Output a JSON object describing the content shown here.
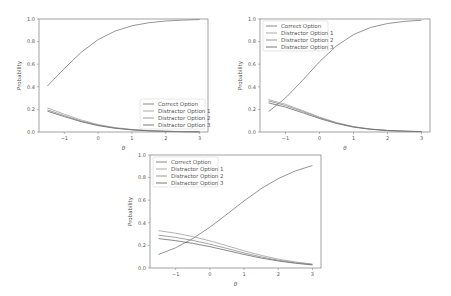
{
  "chart_data": [
    {
      "type": "line",
      "title": "",
      "xlabel": "θ",
      "ylabel": "Probability",
      "xlim": [
        -1.75,
        3.25
      ],
      "ylim": [
        0.0,
        1.0
      ],
      "xticks": [
        -1,
        0,
        1,
        2,
        3
      ],
      "xtick_labels": [
        "−1",
        "0",
        "1",
        "2",
        "3"
      ],
      "yticks": [
        0.0,
        0.2,
        0.4,
        0.6,
        0.8,
        1.0
      ],
      "ytick_labels": [
        "0.0",
        "0.2",
        "0.4",
        "0.6",
        "0.8",
        "1.0"
      ],
      "grid": false,
      "legend_position": "lower right",
      "x": [
        -1.5,
        -1.0,
        -0.5,
        0.0,
        0.5,
        1.0,
        1.5,
        2.0,
        2.5,
        3.0
      ],
      "series": [
        {
          "name": "Correct Option",
          "color": "#7a7a7a",
          "values": [
            0.407,
            0.562,
            0.706,
            0.818,
            0.893,
            0.94,
            0.967,
            0.982,
            0.99,
            0.995
          ]
        },
        {
          "name": "Distractor Option 1",
          "color": "#a0a0a0",
          "values": [
            0.213,
            0.158,
            0.106,
            0.066,
            0.039,
            0.022,
            0.012,
            0.006,
            0.004,
            0.002
          ]
        },
        {
          "name": "Distractor Option 2",
          "color": "#8c8c8c",
          "values": [
            0.196,
            0.145,
            0.097,
            0.06,
            0.035,
            0.02,
            0.011,
            0.006,
            0.003,
            0.002
          ]
        },
        {
          "name": "Distractor Option 3",
          "color": "#6a6a6a",
          "values": [
            0.184,
            0.136,
            0.091,
            0.056,
            0.033,
            0.019,
            0.01,
            0.006,
            0.003,
            0.002
          ]
        }
      ],
      "layout": {
        "left": 39,
        "top": 19,
        "right": 208,
        "bottom": 132
      }
    },
    {
      "type": "line",
      "title": "",
      "xlabel": "θ",
      "ylabel": "Probability",
      "xlim": [
        -1.75,
        3.25
      ],
      "ylim": [
        0.0,
        1.0
      ],
      "xticks": [
        -1,
        0,
        1,
        2,
        3
      ],
      "xtick_labels": [
        "−1",
        "0",
        "1",
        "2",
        "3"
      ],
      "yticks": [
        0.0,
        0.2,
        0.4,
        0.6,
        0.8,
        1.0
      ],
      "ytick_labels": [
        "0.0",
        "0.2",
        "0.4",
        "0.6",
        "0.8",
        "1.0"
      ],
      "grid": false,
      "legend_position": "upper left",
      "x": [
        -1.5,
        -1.0,
        -0.5,
        0.0,
        0.5,
        1.0,
        1.5,
        2.0,
        2.5,
        3.0
      ],
      "series": [
        {
          "name": "Correct Option",
          "color": "#7a7a7a",
          "values": [
            0.18,
            0.301,
            0.457,
            0.622,
            0.762,
            0.862,
            0.925,
            0.96,
            0.979,
            0.989
          ]
        },
        {
          "name": "Distractor Option 1",
          "color": "#a0a0a0",
          "values": [
            0.287,
            0.245,
            0.19,
            0.132,
            0.083,
            0.048,
            0.026,
            0.014,
            0.007,
            0.004
          ]
        },
        {
          "name": "Distractor Option 2",
          "color": "#8c8c8c",
          "values": [
            0.275,
            0.234,
            0.182,
            0.127,
            0.08,
            0.046,
            0.025,
            0.013,
            0.007,
            0.004
          ]
        },
        {
          "name": "Distractor Option 3",
          "color": "#6a6a6a",
          "values": [
            0.258,
            0.22,
            0.171,
            0.119,
            0.075,
            0.043,
            0.024,
            0.013,
            0.007,
            0.003
          ]
        }
      ],
      "layout": {
        "left": 260,
        "top": 19,
        "right": 430,
        "bottom": 132
      }
    },
    {
      "type": "line",
      "title": "",
      "xlabel": "θ",
      "ylabel": "Probability",
      "xlim": [
        -1.75,
        3.25
      ],
      "ylim": [
        0.0,
        1.0
      ],
      "xticks": [
        -1,
        0,
        1,
        2,
        3
      ],
      "xtick_labels": [
        "−1",
        "0",
        "1",
        "2",
        "3"
      ],
      "yticks": [
        0.0,
        0.2,
        0.4,
        0.6,
        0.8,
        1.0
      ],
      "ytick_labels": [
        "0.0",
        "0.2",
        "0.4",
        "0.6",
        "0.8",
        "1.0"
      ],
      "grid": false,
      "legend_position": "upper left",
      "x": [
        -1.5,
        -1.0,
        -0.5,
        0.0,
        0.5,
        1.0,
        1.5,
        2.0,
        2.5,
        3.0
      ],
      "series": [
        {
          "name": "Correct Option",
          "color": "#7a7a7a",
          "values": [
            0.12,
            0.179,
            0.26,
            0.361,
            0.476,
            0.594,
            0.702,
            0.791,
            0.859,
            0.907
          ]
        },
        {
          "name": "Distractor Option 1",
          "color": "#a0a0a0",
          "values": [
            0.33,
            0.308,
            0.278,
            0.24,
            0.197,
            0.152,
            0.112,
            0.078,
            0.053,
            0.035
          ]
        },
        {
          "name": "Distractor Option 2",
          "color": "#8c8c8c",
          "values": [
            0.29,
            0.271,
            0.244,
            0.211,
            0.173,
            0.134,
            0.098,
            0.069,
            0.047,
            0.031
          ]
        },
        {
          "name": "Distractor Option 3",
          "color": "#6a6a6a",
          "values": [
            0.26,
            0.242,
            0.218,
            0.189,
            0.155,
            0.12,
            0.088,
            0.062,
            0.042,
            0.027
          ]
        }
      ],
      "layout": {
        "left": 150,
        "top": 155,
        "right": 321,
        "bottom": 268
      }
    }
  ]
}
